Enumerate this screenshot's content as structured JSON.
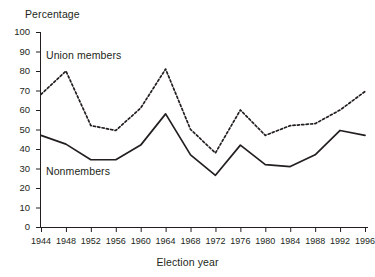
{
  "chart_data": {
    "type": "line",
    "title": "",
    "xlabel": "Election year",
    "ylabel": "Percentage",
    "categories": [
      1944,
      1948,
      1952,
      1956,
      1960,
      1964,
      1968,
      1972,
      1976,
      1980,
      1984,
      1988,
      1992,
      1996
    ],
    "xtick_labels": [
      "1944",
      "1948",
      "1952",
      "1956",
      "1960",
      "1964",
      "1968",
      "1972",
      "1976",
      "1980",
      "1984",
      "1988",
      "1992",
      "1996"
    ],
    "ytick_labels": [
      "100",
      "90",
      "80",
      "70",
      "60",
      "50",
      "40",
      "30",
      "20",
      "10",
      "0"
    ],
    "ytick_values": [
      100,
      90,
      80,
      70,
      60,
      50,
      40,
      30,
      20,
      10,
      0
    ],
    "ylim": [
      0,
      100
    ],
    "grid": false,
    "legend": "inline-annotations",
    "series": [
      {
        "name": "Union members",
        "style": "dashed",
        "color": "#231f20",
        "values": [
          68,
          80,
          52,
          49.5,
          61,
          81,
          50,
          38,
          60,
          47,
          52,
          53,
          60,
          69.5
        ]
      },
      {
        "name": "Nonmembers",
        "style": "solid",
        "color": "#231f20",
        "values": [
          47,
          42.5,
          34.5,
          34.5,
          42,
          58,
          37,
          26.5,
          42,
          32,
          31,
          37,
          49.5,
          47
        ]
      }
    ],
    "annotations": [
      {
        "text": "Union members",
        "series": "Union members"
      },
      {
        "text": "Nonmembers",
        "series": "Nonmembers"
      }
    ]
  }
}
